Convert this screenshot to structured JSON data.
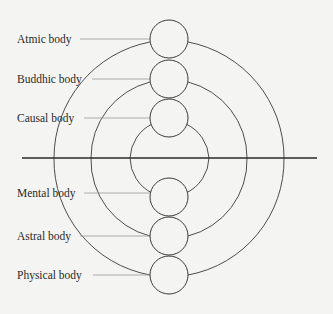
{
  "diagram": {
    "title": "",
    "colors": {
      "background": "#f4f4f2",
      "stroke": "#3a3a3a",
      "leader": "#9a9a9a",
      "text": "#2a2a2a"
    },
    "axis_line": {
      "x1": 22,
      "x2": 317,
      "y": 158
    },
    "arc_center": {
      "x": 169,
      "y": 158
    },
    "bodies": [
      {
        "label": "Atmic body",
        "circle_cy": 39,
        "label_y": 33,
        "leader_x1": 80,
        "arc_r": 117
      },
      {
        "label": "Buddhic body",
        "circle_cy": 79,
        "label_y": 73,
        "leader_x1": 92,
        "arc_r": 78
      },
      {
        "label": "Causal body",
        "circle_cy": 118,
        "label_y": 112,
        "leader_x1": 84,
        "arc_r": 40
      },
      {
        "label": "Mental body",
        "circle_cy": 197,
        "label_y": 188,
        "leader_x1": 84,
        "arc_r": 40
      },
      {
        "label": "Astral body",
        "circle_cy": 236,
        "label_y": 230,
        "leader_x1": 80,
        "arc_r": 78
      },
      {
        "label": "Physical body",
        "circle_cy": 275,
        "label_y": 269,
        "leader_x1": 93,
        "arc_r": 117
      }
    ],
    "circle": {
      "cx": 169,
      "r": 19
    }
  }
}
